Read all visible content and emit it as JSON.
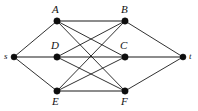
{
  "figure": {
    "background_color": "#ffffff",
    "edge_color": "#1a1a1a",
    "node_color": "#0d0d0d",
    "width": 198,
    "height": 111
  },
  "nodes": [
    {
      "id": "s",
      "label": "s",
      "x": 14,
      "y": 57,
      "r": 3.0,
      "label_x": 4,
      "label_y": 52,
      "label_size": "small"
    },
    {
      "id": "A",
      "label": "A",
      "x": 57,
      "y": 21,
      "r": 3.2,
      "label_x": 52,
      "label_y": 4,
      "label_size": "cap"
    },
    {
      "id": "B",
      "label": "B",
      "x": 125,
      "y": 21,
      "r": 3.2,
      "label_x": 121,
      "label_y": 4,
      "label_size": "cap"
    },
    {
      "id": "D",
      "label": "D",
      "x": 57,
      "y": 57,
      "r": 3.2,
      "label_x": 51,
      "label_y": 40,
      "label_size": "cap"
    },
    {
      "id": "C",
      "label": "C",
      "x": 125,
      "y": 57,
      "r": 3.2,
      "label_x": 120,
      "label_y": 40,
      "label_size": "cap"
    },
    {
      "id": "E",
      "label": "E",
      "x": 57,
      "y": 91,
      "r": 3.2,
      "label_x": 52,
      "label_y": 96,
      "label_size": "cap"
    },
    {
      "id": "F",
      "label": "F",
      "x": 125,
      "y": 91,
      "r": 3.2,
      "label_x": 121,
      "label_y": 96,
      "label_size": "cap"
    },
    {
      "id": "t",
      "label": "t",
      "x": 183,
      "y": 57,
      "r": 3.0,
      "label_x": 189,
      "label_y": 52,
      "label_size": "small"
    }
  ],
  "edges": [
    {
      "from": "s",
      "to": "A",
      "weight": "normal"
    },
    {
      "from": "s",
      "to": "D",
      "weight": "thick"
    },
    {
      "from": "s",
      "to": "E",
      "weight": "normal"
    },
    {
      "from": "A",
      "to": "B",
      "weight": "thick"
    },
    {
      "from": "A",
      "to": "C",
      "weight": "normal"
    },
    {
      "from": "A",
      "to": "F",
      "weight": "normal"
    },
    {
      "from": "D",
      "to": "B",
      "weight": "normal"
    },
    {
      "from": "D",
      "to": "C",
      "weight": "thick"
    },
    {
      "from": "D",
      "to": "F",
      "weight": "normal"
    },
    {
      "from": "E",
      "to": "B",
      "weight": "normal"
    },
    {
      "from": "E",
      "to": "C",
      "weight": "normal"
    },
    {
      "from": "E",
      "to": "F",
      "weight": "thick"
    },
    {
      "from": "B",
      "to": "t",
      "weight": "normal"
    },
    {
      "from": "C",
      "to": "t",
      "weight": "thick"
    },
    {
      "from": "F",
      "to": "t",
      "weight": "normal"
    }
  ]
}
